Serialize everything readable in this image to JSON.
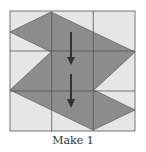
{
  "caption": "Make 1",
  "grid": {
    "rows": 3,
    "cols": 3,
    "x": 10,
    "y": 11,
    "cell": 41.7
  },
  "colors": {
    "cell_bg": "#e6e6e6",
    "grid_line": "#555555",
    "shape_fill": "#8c8c8c",
    "arrow": "#333333"
  },
  "shape": {
    "points": "10,32 51,12 135,52 94,90 135,110 93,130 10,90 51,52"
  },
  "arrows": [
    {
      "x": 71,
      "y1": 32,
      "y2": 64
    },
    {
      "x": 71,
      "y1": 74,
      "y2": 108
    }
  ]
}
